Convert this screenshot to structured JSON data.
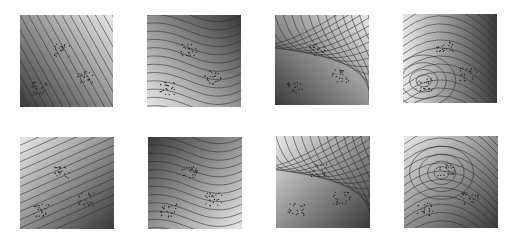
{
  "figure": {
    "layout": {
      "rows": 2,
      "cols": 4
    },
    "panels": [
      {
        "id": "p1",
        "row": 0,
        "col": 0,
        "x": 20,
        "y": 15,
        "w": 93,
        "h": 92,
        "type": "linear",
        "angle": -60,
        "dark": "bottom-left",
        "light": "top-right"
      },
      {
        "id": "p2",
        "row": 0,
        "col": 1,
        "x": 147,
        "y": 15,
        "w": 94,
        "h": 92,
        "type": "curved",
        "dark": "top-right",
        "light": "bottom-left"
      },
      {
        "id": "p3",
        "row": 0,
        "col": 2,
        "x": 275,
        "y": 15,
        "w": 94,
        "h": 90,
        "type": "curved",
        "dark": "bottom-left",
        "light": "top-right"
      },
      {
        "id": "p4",
        "row": 0,
        "col": 3,
        "x": 403,
        "y": 14,
        "w": 94,
        "h": 89,
        "type": "dipole",
        "dark": "right",
        "light": "bottom-left-cluster"
      },
      {
        "id": "p5",
        "row": 1,
        "col": 0,
        "x": 20,
        "y": 137,
        "w": 94,
        "h": 92,
        "type": "linear",
        "angle": 25,
        "dark": "bottom-right",
        "light": "top-left"
      },
      {
        "id": "p6",
        "row": 1,
        "col": 1,
        "x": 148,
        "y": 137,
        "w": 94,
        "h": 92,
        "type": "curved",
        "dark": "top-left",
        "light": "bottom-right"
      },
      {
        "id": "p7",
        "row": 1,
        "col": 2,
        "x": 276,
        "y": 136,
        "w": 94,
        "h": 92,
        "type": "curved",
        "dark": "bottom-right",
        "light": "top-left"
      },
      {
        "id": "p8",
        "row": 1,
        "col": 3,
        "x": 404,
        "y": 136,
        "w": 94,
        "h": 92,
        "type": "dipole",
        "dark": "bottom-right",
        "light": "top-center-cluster"
      }
    ],
    "clusters": [
      {
        "name": "upper-middle",
        "cx": 0.45,
        "cy": 0.38
      },
      {
        "name": "lower-right",
        "cx": 0.7,
        "cy": 0.68
      },
      {
        "name": "lower-left",
        "cx": 0.22,
        "cy": 0.8
      }
    ],
    "colors": {
      "dark": "#3a3a3a",
      "light": "#e8e8e8",
      "contour": "#2a2a2a",
      "point": "#222222"
    }
  }
}
